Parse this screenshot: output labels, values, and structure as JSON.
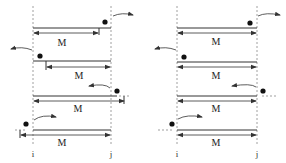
{
  "diagram": {
    "boundary_labels": {
      "left": "i",
      "right": "j"
    },
    "span_label": "M",
    "panels": [
      {
        "id": "left",
        "rows": [
          {
            "span_label": "M",
            "point_side": "right",
            "motion": "exits-right",
            "span_from": "i",
            "span_to": "before-j"
          },
          {
            "span_label": "M",
            "point_side": "left",
            "motion": "exits-left",
            "span_from": "after-i",
            "span_to": "j"
          },
          {
            "span_label": "M",
            "point_side": "right",
            "motion": "enters-left",
            "span_from": "i",
            "span_to": "beyond-j"
          },
          {
            "span_label": "M",
            "point_side": "left",
            "motion": "enters-right",
            "span_from": "beyond-i",
            "span_to": "j"
          }
        ]
      },
      {
        "id": "right",
        "rows": [
          {
            "span_label": "M",
            "point_side": "right",
            "motion": "exits-right",
            "span_from": "i",
            "span_to": "j"
          },
          {
            "span_label": "M",
            "point_side": "left",
            "motion": "exits-left",
            "span_from": "i",
            "span_to": "j"
          },
          {
            "span_label": "M",
            "point_side": "right",
            "motion": "enters-left",
            "span_from": "i",
            "span_to": "j"
          },
          {
            "span_label": "M",
            "point_side": "left",
            "motion": "enters-right",
            "span_from": "i",
            "span_to": "j"
          }
        ]
      }
    ]
  }
}
